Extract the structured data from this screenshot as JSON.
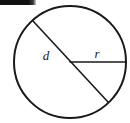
{
  "figure": {
    "kind": "geometry-diagram",
    "background_color": "#ffffff",
    "stroke_color": "#1a1a1a",
    "width": 130,
    "height": 123,
    "top_bar": {
      "name": "top-black-bar",
      "x": 0,
      "y": 0,
      "width": 36,
      "height": 5,
      "color": "#111111"
    },
    "circle": {
      "center_x": 70,
      "center_y": 62,
      "radius": 56,
      "stroke_width": 2
    },
    "diameter_segment": {
      "label": "d",
      "x1": 33,
      "y1": 21,
      "x2": 108,
      "y2": 102,
      "stroke_width": 1.6
    },
    "radius_segment": {
      "label": "r",
      "x1": 70,
      "y1": 62,
      "x2": 126,
      "y2": 62,
      "stroke_width": 1.6
    },
    "labels": [
      {
        "text": "d",
        "x": 46,
        "y": 60,
        "font_size": 13
      },
      {
        "text": "r",
        "x": 95,
        "y": 58,
        "font_size": 13
      }
    ]
  }
}
